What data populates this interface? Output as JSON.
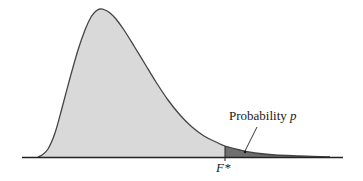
{
  "chart_data": {
    "type": "area",
    "title": "",
    "xlabel": "",
    "ylabel": "",
    "curve_points_px": [
      [
        38,
        157
      ],
      [
        42,
        155
      ],
      [
        48,
        149
      ],
      [
        55,
        133
      ],
      [
        62,
        108
      ],
      [
        70,
        78
      ],
      [
        78,
        50
      ],
      [
        85,
        30
      ],
      [
        91,
        17
      ],
      [
        96,
        11
      ],
      [
        100,
        9
      ],
      [
        105,
        10
      ],
      [
        110,
        13
      ],
      [
        116,
        19
      ],
      [
        124,
        30
      ],
      [
        134,
        46
      ],
      [
        145,
        64
      ],
      [
        156,
        82
      ],
      [
        168,
        100
      ],
      [
        180,
        115
      ],
      [
        192,
        127
      ],
      [
        204,
        136
      ],
      [
        216,
        142
      ],
      [
        225,
        146
      ],
      [
        240,
        150
      ],
      [
        255,
        153
      ],
      [
        275,
        155
      ],
      [
        300,
        156
      ],
      [
        330,
        157
      ]
    ],
    "critical_value_x_px": 225,
    "baseline_y_px": 157,
    "axis_range_px": [
      22,
      343
    ],
    "colors": {
      "body_fill": "#d9d9d9",
      "tail_fill": "#6f6f6f",
      "curve_stroke": "#444444",
      "axis": "#222222"
    },
    "annotations": [
      {
        "text": "Probability p",
        "points_to": "upper tail region"
      },
      {
        "text": "F*",
        "position": "x-axis at critical value"
      }
    ]
  },
  "labels": {
    "probability_prefix": "Probability ",
    "probability_var": "p",
    "critical_value": "F*"
  }
}
